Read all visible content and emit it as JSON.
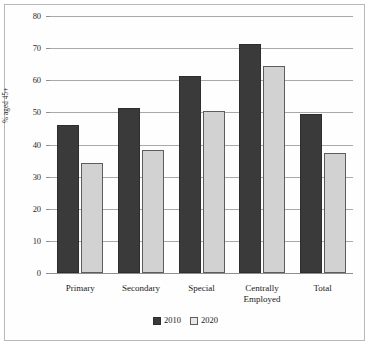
{
  "chart_data": {
    "type": "bar",
    "title": "",
    "xlabel": "",
    "ylabel": "% aged 45+",
    "ylim": [
      0,
      80
    ],
    "ytick_step": 10,
    "yticks": [
      0,
      10,
      20,
      30,
      40,
      50,
      60,
      70,
      80
    ],
    "ytick_labels": [
      "0",
      "10",
      "20",
      "30",
      "40",
      "50",
      "60",
      "70",
      "80"
    ],
    "grid": true,
    "grid_axis": "y",
    "legend_position": "bottom",
    "categories": [
      "Primary",
      "Secondary",
      "Special",
      "Centrally Employed",
      "Total"
    ],
    "category_lines": [
      [
        "Primary"
      ],
      [
        "Secondary"
      ],
      [
        "Special"
      ],
      [
        "Centrally",
        "Employed"
      ],
      [
        "Total"
      ]
    ],
    "series": [
      {
        "name": "2010",
        "color": "#3a3a3a",
        "values": [
          46.1,
          51.3,
          61.4,
          71.4,
          49.5
        ]
      },
      {
        "name": "2020",
        "color": "#d2d2d2",
        "values": [
          34.1,
          38.2,
          50.3,
          64.3,
          37.4
        ]
      }
    ]
  },
  "colors": {
    "series_2010": "#3a3a3a",
    "series_2020": "#d2d2d2",
    "gridline": "#a9a9a9",
    "frame_border": "#b9b9b9",
    "background": "#ffffff",
    "text": "#1a1a1a"
  }
}
